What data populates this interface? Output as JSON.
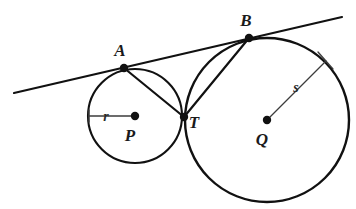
{
  "figure": {
    "background_color": "#ffffff",
    "stroke_color": "#111111",
    "label_color": "#1a1a1a",
    "width": 356,
    "height": 209
  },
  "labels": {
    "point_a": "A",
    "point_b": "B",
    "point_t": "T",
    "center_p": "P",
    "center_q": "Q",
    "radius_small": "r",
    "radius_large": "s"
  },
  "geometry": {
    "circle_small": {
      "name": "circle-p",
      "center_x": 135,
      "center_y": 116,
      "radius": 47,
      "stroke_width": 2.1
    },
    "circle_large": {
      "name": "circle-q",
      "center_x": 267,
      "center_y": 120,
      "radius": 82,
      "stroke_width": 2.4
    },
    "point_a": {
      "x": 124,
      "y": 68
    },
    "point_b": {
      "x": 249,
      "y": 38
    },
    "point_t": {
      "x": 184,
      "y": 117
    },
    "center_p": {
      "x": 135,
      "y": 116
    },
    "center_q": {
      "x": 267,
      "y": 120
    },
    "tangent_line": {
      "x1": 14,
      "y1": 93,
      "x2": 342,
      "y2": 17,
      "stroke_width": 2.2
    },
    "chord_at": {
      "x1": 124,
      "y1": 68,
      "x2": 184,
      "y2": 117,
      "stroke_width": 2.2
    },
    "chord_bt": {
      "x1": 249,
      "y1": 38,
      "x2": 184,
      "y2": 117,
      "stroke_width": 2.2
    },
    "radius_small_leader": {
      "x1": 89,
      "y1": 116,
      "x2": 135,
      "y2": 116,
      "stroke_width": 1.5
    },
    "radius_large_leader": {
      "x1": 267,
      "y1": 120,
      "x2": 326,
      "y2": 61,
      "stroke_width": 1.3
    },
    "radius_large_tick": {
      "x1": 318,
      "y1": 52,
      "x2": 333,
      "y2": 69,
      "stroke_width": 1.3
    },
    "radius_small_tick": {
      "x1": 89,
      "y1": 110,
      "x2": 89,
      "y2": 122,
      "stroke_width": 1.5
    },
    "dot_radius_vertex": 4.2,
    "dot_radius_center": 4.0
  },
  "label_positions": {
    "point_a": {
      "x": 120,
      "y": 56
    },
    "point_b": {
      "x": 246,
      "y": 26
    },
    "point_t": {
      "x": 194,
      "y": 128
    },
    "center_p": {
      "x": 130,
      "y": 141
    },
    "center_q": {
      "x": 262,
      "y": 145
    },
    "radius_small": {
      "x": 106,
      "y": 121
    },
    "radius_large": {
      "x": 296,
      "y": 92
    }
  }
}
